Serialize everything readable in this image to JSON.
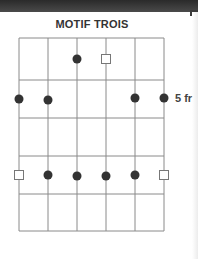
{
  "title": "MOTIF TROIS",
  "fret_label": "5 fr",
  "grid": {
    "strings_x": [
      19,
      48,
      77,
      106,
      135,
      164
    ],
    "frets_y": [
      38,
      80,
      118,
      156,
      194,
      231
    ],
    "line_color": "#8a8a8a"
  },
  "markers": [
    {
      "type": "dot",
      "string": 3,
      "y": 59
    },
    {
      "type": "square",
      "string": 4,
      "y": 59
    },
    {
      "type": "dot",
      "string": 1,
      "y": 99
    },
    {
      "type": "dot",
      "string": 2,
      "y": 100
    },
    {
      "type": "dot",
      "string": 5,
      "y": 98
    },
    {
      "type": "dot",
      "string": 6,
      "y": 98
    },
    {
      "type": "square",
      "string": 1,
      "y": 175
    },
    {
      "type": "dot",
      "string": 2,
      "y": 175
    },
    {
      "type": "dot",
      "string": 3,
      "y": 176
    },
    {
      "type": "dot",
      "string": 4,
      "y": 176
    },
    {
      "type": "dot",
      "string": 5,
      "y": 175
    },
    {
      "type": "square",
      "string": 6,
      "y": 175
    }
  ],
  "colors": {
    "dot": "#333333",
    "square_stroke": "#777777"
  }
}
